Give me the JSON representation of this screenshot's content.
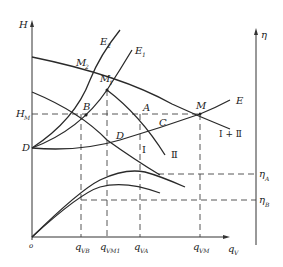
{
  "diagram": {
    "type": "pump parallel operation characteristic curves",
    "axes": {
      "left_y_label": "H",
      "right_y_label": "η",
      "x_label": "q",
      "x_label_sub": "V",
      "origin_label": "o"
    },
    "y_ticks_left": [
      {
        "main": "H",
        "sub": "M"
      },
      {
        "main": "D",
        "sub": ""
      }
    ],
    "y_ticks_right": [
      {
        "main": "η",
        "sub": "A"
      },
      {
        "main": "η",
        "sub": "B"
      }
    ],
    "x_ticks": [
      {
        "main": "q",
        "sub": "VB"
      },
      {
        "main": "q",
        "sub": "VM1"
      },
      {
        "main": "q",
        "sub": "VA"
      },
      {
        "main": "q",
        "sub": "VM"
      }
    ],
    "points": [
      {
        "main": "M",
        "sub": "2"
      },
      {
        "main": "M",
        "sub": "1"
      },
      {
        "main": "B",
        "sub": ""
      },
      {
        "main": "A",
        "sub": ""
      },
      {
        "main": "C",
        "sub": ""
      },
      {
        "main": "M",
        "sub": ""
      },
      {
        "main": "D",
        "sub": ""
      }
    ],
    "curve_labels": [
      {
        "main": "E",
        "sub": "2"
      },
      {
        "main": "E",
        "sub": "1"
      },
      {
        "main": "E",
        "sub": ""
      },
      {
        "main": "Ⅰ",
        "sub": ""
      },
      {
        "main": "Ⅱ",
        "sub": ""
      },
      {
        "main": "Ⅰ + Ⅱ",
        "sub": ""
      }
    ]
  }
}
